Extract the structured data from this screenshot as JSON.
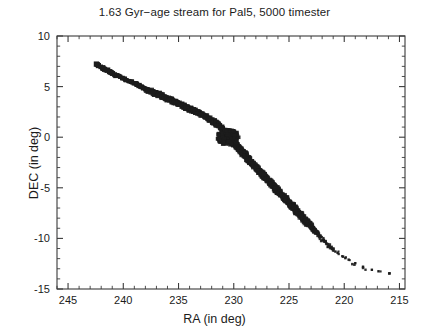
{
  "chart_data": {
    "type": "scatter",
    "title": "1.63 Gyr−age stream for Pal5, 5000 timester",
    "xlabel": "RA (in deg)",
    "ylabel": "DEC (in deg)",
    "xlim": [
      246,
      214.5
    ],
    "ylim": [
      -15,
      10
    ],
    "x_reversed": true,
    "grid": false,
    "legend": null,
    "xticks": [
      245,
      240,
      235,
      230,
      225,
      220,
      215
    ],
    "xticklabels": [
      "245",
      "240",
      "235",
      "230",
      "225",
      "220",
      "215"
    ],
    "x_minor_tick_step": 1,
    "yticks": [
      10,
      5,
      0,
      -5,
      -10,
      -15
    ],
    "yticklabels": [
      "10",
      "5",
      "0",
      "-5",
      "-10",
      "-15"
    ],
    "y_minor_tick_step": 1,
    "marker": "square",
    "marker_color": "#1c1c1c",
    "series": [
      {
        "name": "Pal5 tidal stream particles",
        "points": [
          [
            242.45,
            7.25
          ],
          [
            242.3,
            7.1
          ],
          [
            242.0,
            6.95
          ],
          [
            241.7,
            6.72
          ],
          [
            241.45,
            6.6
          ],
          [
            241.2,
            6.45
          ],
          [
            240.95,
            6.32
          ],
          [
            240.7,
            6.1
          ],
          [
            240.45,
            6.05
          ],
          [
            240.2,
            5.92
          ],
          [
            239.95,
            5.78
          ],
          [
            239.7,
            5.6
          ],
          [
            239.4,
            5.52
          ],
          [
            239.1,
            5.4
          ],
          [
            238.85,
            5.22
          ],
          [
            238.6,
            5.1
          ],
          [
            238.3,
            4.95
          ],
          [
            238.05,
            4.8
          ],
          [
            237.8,
            4.7
          ],
          [
            237.55,
            4.55
          ],
          [
            237.3,
            4.45
          ],
          [
            237.05,
            4.32
          ],
          [
            236.8,
            4.2
          ],
          [
            236.55,
            4.05
          ],
          [
            236.3,
            3.95
          ],
          [
            236.05,
            3.82
          ],
          [
            235.8,
            3.7
          ],
          [
            235.55,
            3.58
          ],
          [
            235.3,
            3.45
          ],
          [
            235.05,
            3.32
          ],
          [
            234.8,
            3.2
          ],
          [
            234.55,
            3.08
          ],
          [
            234.3,
            2.95
          ],
          [
            234.05,
            2.82
          ],
          [
            233.8,
            2.7
          ],
          [
            233.55,
            2.58
          ],
          [
            233.3,
            2.42
          ],
          [
            233.05,
            2.3
          ],
          [
            232.8,
            2.15
          ],
          [
            232.55,
            2.02
          ],
          [
            232.3,
            1.85
          ],
          [
            232.05,
            1.7
          ],
          [
            231.8,
            1.52
          ],
          [
            231.55,
            1.35
          ],
          [
            231.3,
            1.12
          ],
          [
            231.05,
            0.88
          ],
          [
            230.8,
            0.6
          ],
          [
            230.6,
            0.3
          ],
          [
            230.45,
            0.05
          ],
          [
            230.3,
            -0.15
          ],
          [
            230.1,
            -0.4
          ],
          [
            229.9,
            -0.65
          ],
          [
            229.7,
            -0.9
          ],
          [
            229.5,
            -1.15
          ],
          [
            229.3,
            -1.4
          ],
          [
            229.1,
            -1.65
          ],
          [
            228.9,
            -1.9
          ],
          [
            228.7,
            -2.15
          ],
          [
            228.5,
            -2.4
          ],
          [
            228.3,
            -2.62
          ],
          [
            228.1,
            -2.85
          ],
          [
            227.9,
            -3.1
          ],
          [
            227.7,
            -3.32
          ],
          [
            227.5,
            -3.55
          ],
          [
            227.3,
            -3.8
          ],
          [
            227.1,
            -4.02
          ],
          [
            226.9,
            -4.25
          ],
          [
            226.7,
            -4.48
          ],
          [
            226.5,
            -4.7
          ],
          [
            226.3,
            -4.95
          ],
          [
            226.1,
            -5.18
          ],
          [
            225.9,
            -5.42
          ],
          [
            225.7,
            -5.65
          ],
          [
            225.5,
            -5.88
          ],
          [
            225.3,
            -6.12
          ],
          [
            225.1,
            -6.35
          ],
          [
            224.9,
            -6.58
          ],
          [
            224.7,
            -6.82
          ],
          [
            224.5,
            -7.05
          ],
          [
            224.3,
            -7.3
          ],
          [
            224.1,
            -7.52
          ],
          [
            223.9,
            -7.78
          ],
          [
            223.7,
            -8.0
          ],
          [
            223.5,
            -8.25
          ],
          [
            223.3,
            -8.5
          ],
          [
            223.1,
            -8.72
          ],
          [
            222.9,
            -8.98
          ],
          [
            222.7,
            -9.22
          ],
          [
            222.5,
            -9.45
          ],
          [
            222.3,
            -9.7
          ],
          [
            222.1,
            -9.95
          ],
          [
            221.9,
            -10.2
          ],
          [
            221.6,
            -10.5
          ],
          [
            221.3,
            -10.8
          ],
          [
            220.9,
            -11.15
          ],
          [
            220.5,
            -11.5
          ],
          [
            220.0,
            -11.9
          ],
          [
            219.4,
            -12.3
          ],
          [
            218.6,
            -12.8
          ],
          [
            217.6,
            -13.2
          ],
          [
            215.8,
            -13.45
          ]
        ],
        "n_points": 5000,
        "density_note": "particles overlap into a continuous band; sparse discrete squares at the leading end near RA 242 and sparse isolated points in the trailing tail beyond RA 221"
      }
    ],
    "features": [
      {
        "name": "progenitor-cluster",
        "ra": 230.5,
        "dec": 0.0,
        "note": "densest concentration of particles"
      }
    ]
  }
}
